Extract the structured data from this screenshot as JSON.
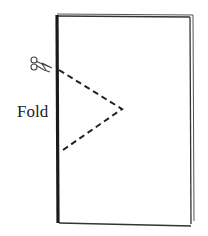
{
  "diagram": {
    "title": "",
    "labels": {
      "fold": "Fold"
    },
    "icons": {
      "scissors": "scissors-icon"
    },
    "colors": {
      "spine": "#1a1a1a",
      "edge": "#333333",
      "dash": "#222222",
      "background": "#ffffff"
    },
    "cut_line": {
      "style": "dashed",
      "points": [
        [
          58,
          70
        ],
        [
          122,
          109
        ],
        [
          62,
          150
        ]
      ]
    }
  }
}
